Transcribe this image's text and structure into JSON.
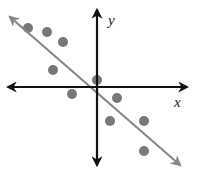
{
  "chart_data": {
    "type": "scatter",
    "title": "",
    "xlabel": "x",
    "ylabel": "y",
    "grid": false,
    "legend": null,
    "axes": {
      "origin_px": [
        97,
        87
      ],
      "x_axis_px": [
        8,
        187
      ],
      "y_axis_px": [
        10,
        165
      ],
      "color": "#111111"
    },
    "points_px": [
      [
        28,
        28
      ],
      [
        47,
        32
      ],
      [
        63,
        42
      ],
      [
        53,
        70
      ],
      [
        97,
        80
      ],
      [
        72,
        94
      ],
      [
        117,
        98
      ],
      [
        110,
        121
      ],
      [
        144,
        121
      ],
      [
        144,
        151
      ]
    ],
    "point_color": "#777777",
    "trend_line": {
      "description": "line of best fit, negative slope, passes near origin",
      "from_px": [
        10,
        17
      ],
      "to_px": [
        180,
        165
      ],
      "color": "#888888"
    }
  },
  "labels": {
    "x": "x",
    "y": "y"
  }
}
